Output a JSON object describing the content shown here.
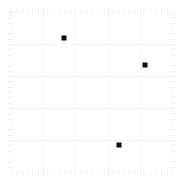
{
  "chart_data": {
    "type": "scatter",
    "title": "",
    "subtitle": "",
    "xlabel": "",
    "ylabel": "",
    "xlim": [
      0,
      1
    ],
    "ylim": [
      0,
      1
    ],
    "grid": true,
    "legend": false,
    "legend_position": "none",
    "xticklabels": [],
    "yticklabels": [],
    "xticks": [
      0.0,
      0.2,
      0.4,
      0.6,
      0.8,
      1.0
    ],
    "yticks": [
      0.0,
      0.2,
      0.4,
      0.6,
      0.8,
      1.0
    ],
    "marker_color": "#0d0d0d",
    "marker_shape": "square",
    "grid_color": "#f2f2f2",
    "spine_color": "#d9d9d9",
    "background_color": "#ffffff",
    "series": [
      {
        "name": "points",
        "points": [
          {
            "x": 0.33,
            "y": 0.84
          },
          {
            "x": 0.83,
            "y": 0.67
          },
          {
            "x": 0.67,
            "y": 0.17
          }
        ]
      }
    ]
  },
  "figure": {
    "width": 184,
    "height": 180,
    "plot_left": 11,
    "plot_top": 12,
    "plot_width": 161,
    "plot_height": 160
  }
}
